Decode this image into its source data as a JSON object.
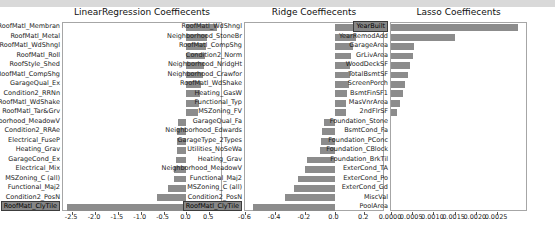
{
  "figure": {
    "background": "#ffffff",
    "top_band_color": "#d9d9d9",
    "frame_color": "#a6a6a6",
    "text_color": "#1a1a1a"
  },
  "chart_data": [
    {
      "type": "bar",
      "orientation": "horizontal",
      "title": "LinearRegression Coeffiecents",
      "xlabel": "",
      "ylabel": "",
      "xlim": [
        -2.7,
        0.8
      ],
      "grid": false,
      "bar_color": "#8c8c8c",
      "highlight_fill": "#868686",
      "highlighted_category": "RoofMatl_ClyTile",
      "xticks": [
        -2.5,
        -2.0,
        -1.5,
        -1.0,
        -0.5,
        0.0,
        0.5
      ],
      "xtick_labels": [
        "-2.5",
        "-2.0",
        "-1.5",
        "-1.0",
        "-0.5",
        "0.0",
        "0.5"
      ],
      "categories": [
        "RoofMatl_Membran",
        "RoofMatl_Metal",
        "RoofMatl_WdShngl",
        "RoofMatl_Roll",
        "RoofStyle_Shed",
        "RoofMatl_CompShg",
        "GarageQual_Ex",
        "Condition2_RRNn",
        "RoofMatl_WdShake",
        "RoofMatl_Tar&Grv",
        "Neighborhood_MeadowV",
        "Condition2_RRAe",
        "Electrical_FuseP",
        "Heating_Grav",
        "GarageCond_Ex",
        "Electrical_Mix",
        "MSZoning_C (all)",
        "Functional_Maj2",
        "Condition2_PosN",
        "RoofMatl_ClyTile"
      ],
      "values": [
        0.67,
        0.46,
        0.42,
        0.4,
        0.39,
        0.37,
        0.31,
        0.29,
        0.28,
        0.26,
        -0.19,
        -0.2,
        -0.2,
        -0.21,
        -0.22,
        -0.27,
        -0.28,
        -0.41,
        -0.65,
        -2.62
      ]
    },
    {
      "type": "bar",
      "orientation": "horizontal",
      "title": "Ridge Coeffiecents",
      "xlabel": "",
      "ylabel": "",
      "xlim": [
        -0.603,
        0.34
      ],
      "grid": false,
      "bar_color": "#8c8c8c",
      "highlight_fill": "#868686",
      "highlighted_category": "RoofMatl_ClyTile",
      "xticks": [
        -0.6,
        -0.4,
        -0.2,
        0.0,
        0.2
      ],
      "xtick_labels": [
        "-0.6",
        "-0.4",
        "-0.2",
        "0.0",
        "0.2"
      ],
      "categories": [
        "RoofMatl_WdShngl",
        "Neighborhood_StoneBr",
        "RoofMatl_CompShg",
        "Condition2_Norm",
        "Neighborhood_NridgHt",
        "Neighborhood_Crawfor",
        "RoofMatl_WdShake",
        "Heating_GasW",
        "Functional_Typ",
        "MSZoning_FV",
        "GarageQual_Fa",
        "Neighborhood_Edwards",
        "GarageType_2Types",
        "Utilities_NoSeWa",
        "Heating_Grav",
        "Neighborhood_MeadowV",
        "Functional_Maj2",
        "MSZoning_C (all)",
        "Condition2_PosN",
        "RoofMatl_ClyTile"
      ],
      "values": [
        0.21,
        0.148,
        0.125,
        0.113,
        0.106,
        0.101,
        0.096,
        0.086,
        0.079,
        0.074,
        -0.072,
        -0.086,
        -0.092,
        -0.096,
        -0.185,
        -0.199,
        -0.248,
        -0.271,
        -0.334,
        -0.55
      ]
    },
    {
      "type": "bar",
      "orientation": "horizontal",
      "title": "Lasso Coeffiecents",
      "xlabel": "",
      "ylabel": "",
      "xlim": [
        0.0,
        0.00323
      ],
      "grid": false,
      "bar_color": "#8c8c8c",
      "highlight_fill": "#868686",
      "highlighted_category": "YearBuilt",
      "xticks": [
        0.0,
        0.0005,
        0.001,
        0.0015,
        0.002,
        0.0025
      ],
      "xtick_labels": [
        "0.0000",
        "0.0005",
        "0.0010",
        "0.0015",
        "0.0020",
        "0.0025"
      ],
      "categories": [
        "YearBuilt",
        "YearRemodAdd",
        "GarageArea",
        "GrLivArea",
        "WoodDeckSF",
        "TotalBsmtSF",
        "ScreenPorch",
        "BsmtFinSF1",
        "MasVnrArea",
        "2ndFlrSF",
        "Foundation_Stone",
        "BsmtCond_Fa",
        "Foundation_PConc",
        "Foundation_CBlock",
        "Foundation_BrkTil",
        "ExterCond_TA",
        "ExterCond_Po",
        "ExterCond_Gd",
        "MiscVal",
        "PoolArea"
      ],
      "values": [
        0.003,
        0.0015,
        0.00055,
        0.00051,
        0.00044,
        0.0004,
        0.00034,
        0.00028,
        0.00022,
        0.00015,
        0.0,
        0.0,
        0.0,
        0.0,
        0.0,
        0.0,
        0.0,
        0.0,
        0.0,
        0.0
      ]
    }
  ]
}
